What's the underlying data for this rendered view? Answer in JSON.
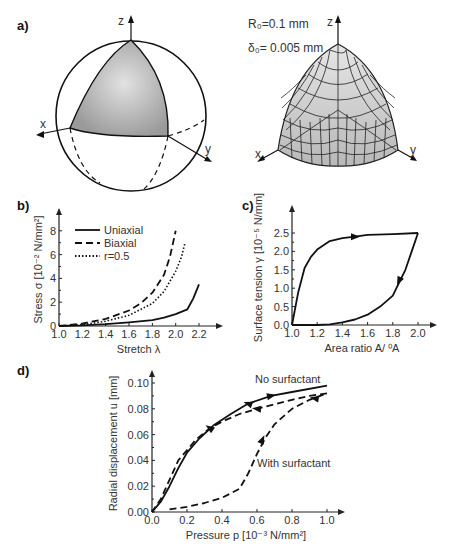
{
  "panels": {
    "a": {
      "label": "a)",
      "params": [
        "R₀=0.1 mm",
        "δ₀= 0.005 mm"
      ],
      "axes_left": {
        "x": "x",
        "y": "y",
        "z": "z"
      },
      "axes_right": {
        "x": "x",
        "y": "y",
        "z": "z"
      }
    },
    "b": {
      "label": "b)"
    },
    "c": {
      "label": "c)"
    },
    "d": {
      "label": "d)"
    }
  },
  "chart_data": [
    {
      "id": "b",
      "type": "line",
      "xlabel": "Stretch λ",
      "ylabel": "Stress σ [10⁻² N/mm²]",
      "xticks": [
        "1.0",
        "1.2",
        "1.4",
        "1.6",
        "1.8",
        "2.0",
        "2.2"
      ],
      "yticks": [
        "0",
        "2",
        "4",
        "6",
        "8"
      ],
      "xlim": [
        1.0,
        2.3
      ],
      "ylim": [
        0,
        9
      ],
      "legend": [
        "Uniaxial",
        "Biaxial",
        "r=0.5"
      ],
      "series": [
        {
          "name": "Uniaxial",
          "style": "solid",
          "x": [
            1.0,
            1.2,
            1.4,
            1.6,
            1.8,
            1.9,
            2.0,
            2.1,
            2.15,
            2.2
          ],
          "y": [
            0,
            0.05,
            0.15,
            0.3,
            0.5,
            0.7,
            1.0,
            1.4,
            2.3,
            3.5
          ]
        },
        {
          "name": "Biaxial",
          "style": "dashed",
          "x": [
            1.0,
            1.2,
            1.4,
            1.6,
            1.7,
            1.8,
            1.9,
            1.95,
            2.0
          ],
          "y": [
            0,
            0.2,
            0.6,
            1.3,
            1.9,
            2.8,
            4.3,
            5.8,
            8.0
          ]
        },
        {
          "name": "r=0.5",
          "style": "dotted",
          "x": [
            1.0,
            1.2,
            1.4,
            1.6,
            1.8,
            1.9,
            2.0,
            2.05,
            2.08
          ],
          "y": [
            0,
            0.1,
            0.4,
            0.9,
            1.9,
            2.9,
            4.6,
            5.8,
            7.0
          ]
        }
      ]
    },
    {
      "id": "c",
      "type": "line",
      "xlabel": "Area ratio A/ ⁰A",
      "ylabel": "Surface tension γ [10⁻⁵ N/mm]",
      "xticks": [
        "1.0",
        "1.2",
        "1.4",
        "1.6",
        "1.8",
        "2.0"
      ],
      "yticks": [
        "0.0",
        "0.5",
        "1.0",
        "1.5",
        "2.0",
        "2.5"
      ],
      "xlim": [
        1.0,
        2.1
      ],
      "ylim": [
        0,
        2.9
      ],
      "series": [
        {
          "name": "expansion",
          "style": "solid",
          "x": [
            1.0,
            1.05,
            1.1,
            1.15,
            1.2,
            1.3,
            1.4,
            1.5,
            1.6,
            1.8,
            2.0
          ],
          "y": [
            0,
            0.9,
            1.55,
            1.85,
            2.05,
            2.28,
            2.36,
            2.4,
            2.45,
            2.47,
            2.5
          ]
        },
        {
          "name": "compression",
          "style": "solid",
          "x": [
            2.0,
            1.95,
            1.9,
            1.85,
            1.8,
            1.7,
            1.6,
            1.5,
            1.4,
            1.3,
            1.2,
            1.0
          ],
          "y": [
            2.5,
            2.0,
            1.5,
            1.15,
            0.8,
            0.5,
            0.28,
            0.15,
            0.07,
            0.02,
            0,
            0
          ]
        }
      ]
    },
    {
      "id": "d",
      "type": "line",
      "xlabel": "Pressure p [10⁻³ N/mm²]",
      "ylabel": "Radial displacement u [mm]",
      "xticks": [
        "0.0",
        "0.2",
        "0.4",
        "0.6",
        "0.8",
        "1.0"
      ],
      "yticks": [
        "0.00",
        "0.02",
        "0.04",
        "0.06",
        "0.08",
        "0.10"
      ],
      "xlim": [
        0,
        1.0
      ],
      "ylim": [
        0,
        0.105
      ],
      "annotations": [
        "No surfactant",
        "With surfactant"
      ],
      "series": [
        {
          "name": "No surfactant",
          "style": "solid",
          "x": [
            0,
            0.05,
            0.1,
            0.15,
            0.2,
            0.27,
            0.35,
            0.45,
            0.55,
            0.68,
            0.8,
            1.0
          ],
          "y": [
            0,
            0.008,
            0.02,
            0.034,
            0.046,
            0.057,
            0.067,
            0.076,
            0.084,
            0.09,
            0.093,
            0.098
          ]
        },
        {
          "name": "With surfactant (loading)",
          "style": "dashed",
          "x": [
            0.1,
            0.2,
            0.3,
            0.4,
            0.5,
            0.55,
            0.6,
            0.65,
            0.7,
            0.8,
            0.9,
            1.0
          ],
          "y": [
            0.002,
            0.004,
            0.007,
            0.011,
            0.018,
            0.03,
            0.045,
            0.058,
            0.068,
            0.08,
            0.087,
            0.092
          ]
        },
        {
          "name": "With surfactant (unloading)",
          "style": "dashed",
          "x": [
            1.0,
            0.9,
            0.8,
            0.6,
            0.5,
            0.4,
            0.33,
            0.25,
            0.15,
            0.1,
            0.05,
            0
          ],
          "y": [
            0.092,
            0.09,
            0.087,
            0.08,
            0.076,
            0.07,
            0.065,
            0.056,
            0.04,
            0.025,
            0.01,
            0
          ]
        }
      ]
    }
  ]
}
